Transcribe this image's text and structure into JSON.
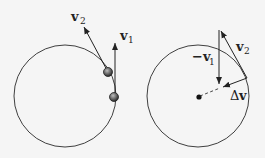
{
  "diagram": {
    "left_panel": {
      "labels": {
        "v2": "v",
        "v2_sub": "2",
        "v1": "v",
        "v1_sub": "1"
      }
    },
    "right_panel": {
      "labels": {
        "neg_v1_prefix": "−v",
        "neg_v1_sub": "1",
        "v2": "v",
        "v2_sub": "2",
        "delta_v_prefix": "Δ",
        "delta_v": "v"
      }
    },
    "colors": {
      "line": "#2a2a2a",
      "ball": "#6a6a6a",
      "background": "#f5f5f5"
    }
  }
}
